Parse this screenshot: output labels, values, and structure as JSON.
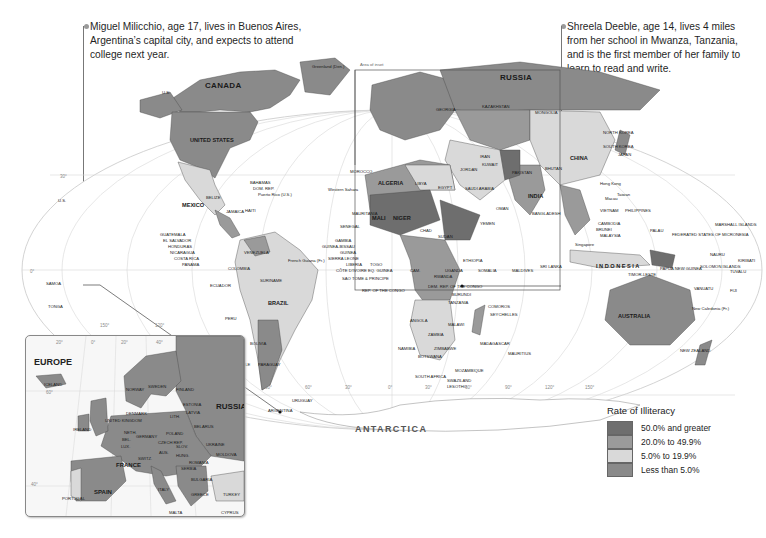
{
  "callouts": {
    "left": {
      "text_lines": [
        "Miguel Milicchio, age 17, lives in Buenos Aires,",
        "Argentina’s capital city, and expects to attend",
        "college next year."
      ]
    },
    "right": {
      "text_lines": [
        "Shreela Deeble, age 14, lives 4 miles",
        "from her school in Mwanza, Tanzania,",
        "and is the first member of her family to",
        "learn to read and write."
      ]
    }
  },
  "map": {
    "ocean_labels": {
      "antarctica": "ANTARCTICA"
    },
    "inset_area_label": "Area of inset",
    "countries": {
      "canada": "CANADA",
      "us": "UNITED STATES",
      "us_alaska": "U.S.",
      "us_hawaii": "U.S.",
      "greenland": "Greenland (Den.)",
      "mexico": "MEXICO",
      "brazil": "BRAZIL",
      "venezuela": "VENEZUELA",
      "colombia": "COLOMBIA",
      "peru": "PERU",
      "ecuador": "ECUADOR",
      "bolivia": "BOLIVIA",
      "chile": "CHILE",
      "paraguay": "PARAGUAY",
      "uruguay": "URUGUAY",
      "argentina": "ARGENTINA",
      "suriname": "SURINAME",
      "guyana": "GUYANA",
      "french_guiana": "French Guiana (Fr.)",
      "belize": "BELIZE",
      "guatemala": "GUATEMALA",
      "el_salvador": "EL SALVADOR",
      "honduras": "HONDURAS",
      "nicaragua": "NICARAGUA",
      "costa_rica": "COSTA RICA",
      "panama": "PANAMA",
      "bahamas": "BAHAMAS",
      "dom_rep": "DOM. REP.",
      "puerto_rico": "Puerto Rico (U.S.)",
      "jamaica": "JAMAICA",
      "haiti": "HAITI",
      "russia": "RUSSIA",
      "china": "CHINA",
      "india": "INDIA",
      "mongolia": "MONGOLIA",
      "kazakhstan": "KAZAKHSTAN",
      "georgia": "GEORGIA",
      "pakistan": "PAKISTAN",
      "iran": "IRAN",
      "kuwait": "KUWAIT",
      "saudi_arabia": "SAUDI ARABIA",
      "oman": "OMAN",
      "yemen": "YEMEN",
      "jordan": "JORDAN",
      "bangladesh": "BANGLADESH",
      "sri_lanka": "SRI LANKA",
      "maldives": "MALDIVES",
      "bhutan": "BHUTAN",
      "morocco": "MOROCCO",
      "algeria": "ALGERIA",
      "libya": "LIBYA",
      "egypt": "EGYPT",
      "mali": "MALI",
      "niger": "NIGER",
      "chad": "CHAD",
      "sudan": "SUDAN",
      "ethiopia": "ETHIOPIA",
      "somalia": "SOMALIA",
      "mauritania": "MAURITANIA",
      "western_sahara": "Western Sahara",
      "senegal": "SENEGAL",
      "gambia": "GAMBIA",
      "guinea_bissau": "GUINEA-BISSAU",
      "guinea": "GUINEA",
      "sierra_leone": "SIERRA LEONE",
      "liberia": "LIBERIA",
      "cote_divoire": "CÔTE D'IVOIRE",
      "togo": "TOGO",
      "eq_guinea": "EQ. GUINEA",
      "sao_tome": "SAO TOME & PRINCIPE",
      "rep_congo": "REP. OF THE CONGO",
      "dem_rep_congo": "DEM. REP. OF THE CONGO",
      "uganda": "UGANDA",
      "rwanda": "RWANDA",
      "burundi": "BURUNDI",
      "tanzania": "TANZANIA",
      "angola": "ANGOLA",
      "zambia": "ZAMBIA",
      "malawi": "MALAWI",
      "namibia": "NAMIBIA",
      "botswana": "BOTSWANA",
      "zimbabwe": "ZIMBABWE",
      "mozambique": "MOZAMBIQUE",
      "madagascar": "MADAGASCAR",
      "south_africa": "SOUTH AFRICA",
      "swaziland": "SWAZILAND",
      "lesotho": "LESOTHO",
      "comoros": "COMOROS",
      "seychelles": "SEYCHELLES",
      "mauritius": "MAURITIUS",
      "cameroon": "CAM.",
      "philippines": "PHILIPPINES",
      "vietnam": "VIETNAM",
      "cambodia": "CAMBODIA",
      "malaysia": "MALAYSIA",
      "brunei": "BRUNEI",
      "singapore": "Singapore",
      "indonesia": "I N D O N E S I A",
      "timor_leste": "TIMOR-LESTE",
      "papua_new_guinea": "PAPUA NEW GUINEA",
      "australia": "AUSTRALIA",
      "new_zealand": "NEW ZEALAND",
      "north_korea": "NORTH KOREA",
      "south_korea": "SOUTH KOREA",
      "japan": "JAPAN",
      "taiwan": "Taiwan",
      "hong_kong": "Hong Kong",
      "macau": "Macau",
      "palau": "PALAU",
      "micronesia": "FEDERATED STATES OF MICRONESIA",
      "marshall_islands": "MARSHALL ISLANDS",
      "nauru": "NAURU",
      "kiribati": "KIRIBATI",
      "solomon_islands": "SOLOMON ISLANDS",
      "tuvalu": "TUVALU",
      "vanuatu": "VANUATU",
      "fiji": "FIJI",
      "new_caledonia": "New Caledonia (Fr.)",
      "samoa": "SAMOA",
      "tonga": "TONGA"
    },
    "degree_labels": {
      "lat": [
        "30°",
        "0°",
        "30°"
      ],
      "lon": [
        "150°",
        "120°",
        "90°",
        "60°",
        "30°",
        "0°",
        "30°",
        "60°",
        "90°",
        "120°",
        "150°"
      ]
    }
  },
  "inset": {
    "title": "EUROPE",
    "countries": {
      "russia": "RUSSIA",
      "iceland": "ICELAND",
      "norway": "NORWAY",
      "sweden": "SWEDEN",
      "finland": "FINLAND",
      "estonia": "ESTONIA",
      "latvia": "LATVIA",
      "lithuania": "LITH.",
      "denmark": "DENMARK",
      "uk": "UNITED KINGDOM",
      "ireland": "IRELAND",
      "netherlands": "NETH.",
      "belgium": "BEL.",
      "lux": "LUX.",
      "germany": "GERMANY",
      "poland": "POLAND",
      "belarus": "BELARUS",
      "ukraine": "UKRAINE",
      "moldova": "MOLDOVA",
      "czech": "CZECH REP.",
      "slovakia": "SLOV.",
      "austria": "AUS.",
      "hungary": "HUNG.",
      "romania": "ROMANIA",
      "switzerland": "SWITZ.",
      "france": "FRANCE",
      "italy": "ITALY",
      "serbia": "SERBIA",
      "bulgaria": "BULGARIA",
      "greece": "GREECE",
      "spain": "SPAIN",
      "portugal": "PORTUGAL",
      "turkey": "TURKEY",
      "malta": "MALTA",
      "cyprus": "CYPRUS"
    },
    "degree_labels": [
      "20°",
      "0°",
      "20°",
      "40°",
      "60°",
      "40°"
    ]
  },
  "legend": {
    "title": "Rate of Illiteracy",
    "items": [
      {
        "label": "50.0% and greater",
        "color": "#6e6e6e"
      },
      {
        "label": "20.0% to 49.9%",
        "color": "#9a9a9a"
      },
      {
        "label": "5.0% to 19.9%",
        "color": "#d9d9d9"
      },
      {
        "label": "Less than 5.0%",
        "color": "#8a8a8a"
      }
    ]
  },
  "colors": {
    "ocean": "#ffffff",
    "graticule": "#d4d4d4",
    "leader_line": "#555555"
  }
}
